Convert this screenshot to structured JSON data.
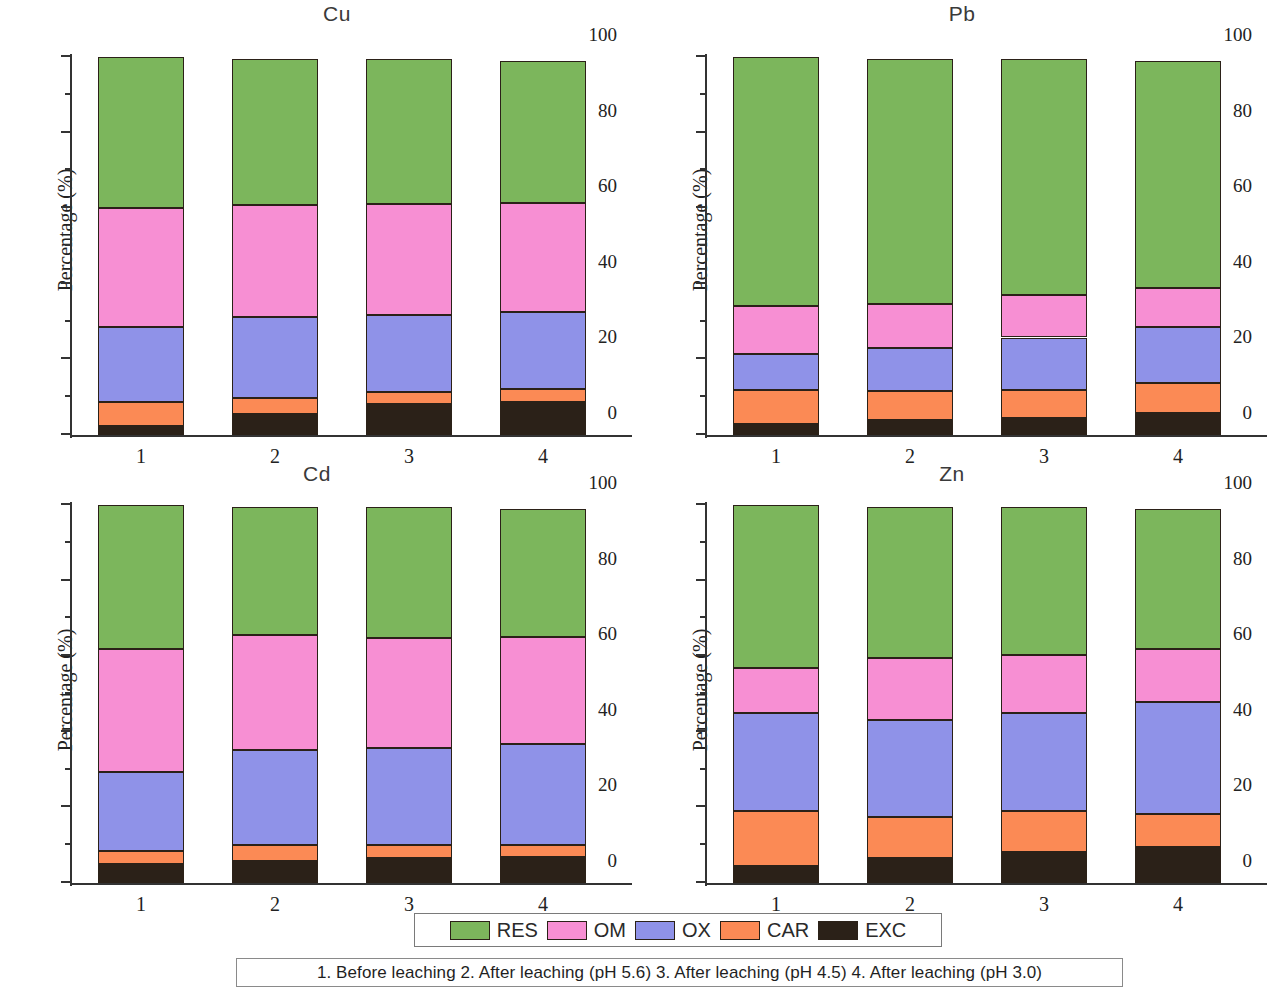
{
  "figure": {
    "caption": "1. Before leaching 2. After leaching (pH 5.6) 3. After leaching (pH 4.5) 4. After leaching (pH 3.0)",
    "ylabel": "Percentage (%)",
    "ytick_labels": [
      "0",
      "20",
      "40",
      "60",
      "80",
      "100"
    ],
    "xtick_labels": [
      "1",
      "2",
      "3",
      "4"
    ]
  },
  "legend": {
    "position": "bottom-center",
    "items": [
      {
        "label": "RES",
        "color": "#7cb65c"
      },
      {
        "label": "OM",
        "color": "#f78fd3"
      },
      {
        "label": "OX",
        "color": "#8f92e8"
      },
      {
        "label": "CAR",
        "color": "#fb8a55"
      },
      {
        "label": "EXC",
        "color": "#2b2118"
      }
    ]
  },
  "panels": [
    {
      "key": "cu",
      "title": "Cu"
    },
    {
      "key": "pb",
      "title": "Pb"
    },
    {
      "key": "cd",
      "title": "Cd"
    },
    {
      "key": "zn",
      "title": "Zn"
    }
  ],
  "chart_data": [
    {
      "type": "bar",
      "title": "Cu",
      "stacked": true,
      "xlabel": "",
      "ylabel": "Percentage (%)",
      "ylim": [
        0,
        100
      ],
      "yticks": [
        0,
        20,
        40,
        60,
        80,
        100
      ],
      "grid": false,
      "categories": [
        "1",
        "2",
        "3",
        "4"
      ],
      "series": [
        {
          "name": "EXC",
          "color": "#2b2118",
          "values": [
            2.4,
            5.5,
            8.2,
            8.7
          ]
        },
        {
          "name": "CAR",
          "color": "#fb8a55",
          "values": [
            6.3,
            4.3,
            3.2,
            3.5
          ]
        },
        {
          "name": "OX",
          "color": "#8f92e8",
          "values": [
            19.9,
            21.4,
            20.3,
            20.3
          ]
        },
        {
          "name": "OM",
          "color": "#f78fd3",
          "values": [
            31.4,
            29.6,
            29.3,
            28.9
          ]
        },
        {
          "name": "RES",
          "color": "#7cb65c",
          "values": [
            40.0,
            39.2,
            39.0,
            37.6
          ]
        }
      ],
      "cumulative_tops": {
        "EXC": [
          2.4,
          5.5,
          8.2,
          8.7
        ],
        "CAR": [
          8.7,
          9.8,
          11.4,
          12.2
        ],
        "OX": [
          28.6,
          31.2,
          31.7,
          32.5
        ],
        "OM": [
          60.0,
          60.8,
          61.0,
          61.4
        ],
        "RES": [
          100.0,
          99.6,
          99.5,
          99.0
        ]
      }
    },
    {
      "type": "bar",
      "title": "Pb",
      "stacked": true,
      "xlabel": "",
      "ylabel": "Percentage (%)",
      "ylim": [
        0,
        100
      ],
      "yticks": [
        0,
        20,
        40,
        60,
        80,
        100
      ],
      "grid": false,
      "categories": [
        "1",
        "2",
        "3",
        "4"
      ],
      "series": [
        {
          "name": "EXC",
          "color": "#2b2118",
          "values": [
            3.0,
            4.0,
            4.6,
            5.8
          ]
        },
        {
          "name": "CAR",
          "color": "#fb8a55",
          "values": [
            9.0,
            7.7,
            7.2,
            8.0
          ]
        },
        {
          "name": "OX",
          "color": "#8f92e8",
          "values": [
            9.5,
            11.3,
            14.0,
            14.7
          ]
        },
        {
          "name": "OM",
          "color": "#f78fd3",
          "values": [
            12.5,
            11.7,
            11.2,
            10.4
          ]
        },
        {
          "name": "RES",
          "color": "#7cb65c",
          "values": [
            66.0,
            64.9,
            62.5,
            60.1
          ]
        }
      ],
      "cumulative_tops": {
        "EXC": [
          3.0,
          4.0,
          4.6,
          5.8
        ],
        "CAR": [
          12.0,
          11.7,
          11.8,
          13.8
        ],
        "OX": [
          21.5,
          23.0,
          25.8,
          28.5
        ],
        "OM": [
          34.0,
          34.7,
          37.0,
          38.9
        ],
        "RES": [
          100.0,
          99.6,
          99.5,
          99.0
        ]
      }
    },
    {
      "type": "bar",
      "title": "Cd",
      "stacked": true,
      "xlabel": "",
      "ylabel": "Percentage (%)",
      "ylim": [
        0,
        100
      ],
      "yticks": [
        0,
        20,
        40,
        60,
        80,
        100
      ],
      "grid": false,
      "categories": [
        "1",
        "2",
        "3",
        "4"
      ],
      "series": [
        {
          "name": "EXC",
          "color": "#2b2118",
          "values": [
            5.0,
            5.8,
            6.6,
            6.9
          ]
        },
        {
          "name": "CAR",
          "color": "#fb8a55",
          "values": [
            3.5,
            4.2,
            3.4,
            3.1
          ]
        },
        {
          "name": "OX",
          "color": "#8f92e8",
          "values": [
            21.0,
            25.3,
            25.8,
            26.7
          ]
        },
        {
          "name": "OM",
          "color": "#f78fd3",
          "values": [
            32.3,
            30.3,
            28.9,
            28.3
          ]
        },
        {
          "name": "RES",
          "color": "#7cb65c",
          "values": [
            38.2,
            34.0,
            34.8,
            34.0
          ]
        }
      ],
      "cumulative_tops": {
        "EXC": [
          5.0,
          5.8,
          6.6,
          6.9
        ],
        "CAR": [
          8.5,
          10.0,
          10.0,
          10.0
        ],
        "OX": [
          29.5,
          35.3,
          35.8,
          36.7
        ],
        "OM": [
          61.8,
          65.6,
          64.7,
          65.0
        ],
        "RES": [
          100.0,
          99.6,
          99.5,
          99.0
        ]
      }
    },
    {
      "type": "bar",
      "title": "Zn",
      "stacked": true,
      "xlabel": "",
      "ylabel": "Percentage (%)",
      "ylim": [
        0,
        100
      ],
      "yticks": [
        0,
        20,
        40,
        60,
        80,
        100
      ],
      "grid": false,
      "categories": [
        "1",
        "2",
        "3",
        "4"
      ],
      "series": [
        {
          "name": "EXC",
          "color": "#2b2118",
          "values": [
            4.5,
            6.5,
            8.3,
            9.5
          ]
        },
        {
          "name": "CAR",
          "color": "#fb8a55",
          "values": [
            14.5,
            11.0,
            10.7,
            8.7
          ]
        },
        {
          "name": "OX",
          "color": "#8f92e8",
          "values": [
            26.0,
            25.5,
            26.0,
            29.8
          ]
        },
        {
          "name": "OM",
          "color": "#f78fd3",
          "values": [
            12.0,
            16.5,
            15.3,
            14.0
          ]
        },
        {
          "name": "RES",
          "color": "#7cb65c",
          "values": [
            43.0,
            40.1,
            39.2,
            37.0
          ]
        }
      ],
      "cumulative_tops": {
        "EXC": [
          4.5,
          6.5,
          8.3,
          9.5
        ],
        "CAR": [
          19.0,
          17.5,
          19.0,
          18.2
        ],
        "OX": [
          45.0,
          43.0,
          45.0,
          48.0
        ],
        "OM": [
          57.0,
          59.5,
          60.3,
          62.0
        ],
        "RES": [
          100.0,
          99.6,
          99.5,
          99.0
        ]
      }
    }
  ]
}
